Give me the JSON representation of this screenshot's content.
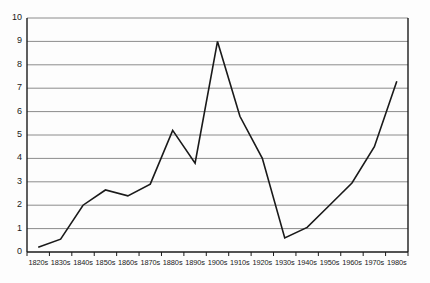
{
  "chart_data": {
    "type": "line",
    "title": "",
    "subtitle": "",
    "xlabel": "",
    "ylabel": "",
    "categories": [
      "1820s",
      "1830s",
      "1840s",
      "1850s",
      "1860s",
      "1870s",
      "1880s",
      "1890s",
      "1900s",
      "1910s",
      "1920s",
      "1930s",
      "1940s",
      "1950s",
      "1960s",
      "1970s",
      "1980s"
    ],
    "values": [
      0.2,
      0.55,
      2.0,
      2.65,
      2.4,
      2.9,
      5.2,
      3.8,
      9.0,
      5.8,
      4.0,
      0.6,
      1.05,
      2.0,
      2.95,
      4.5,
      7.3
    ],
    "series": [
      {
        "name": "series-1",
        "values": [
          0.2,
          0.55,
          2.0,
          2.65,
          2.4,
          2.9,
          5.2,
          3.8,
          9.0,
          5.8,
          4.0,
          0.6,
          1.05,
          2.0,
          2.95,
          4.5,
          7.3
        ]
      }
    ],
    "ylim": [
      0,
      10
    ],
    "y_ticks": [
      0,
      1,
      2,
      3,
      4,
      5,
      6,
      7,
      8,
      9,
      10
    ],
    "y_tick_labels": [
      "0",
      "1",
      "2",
      "3",
      "4",
      "5",
      "6",
      "7",
      "8",
      "9",
      "10"
    ],
    "grid": true,
    "grid_axis": "y",
    "legend": false,
    "legend_position": "none",
    "annotations": []
  },
  "style": {
    "line_color": "#1a1a1a",
    "grid_color": "#8c8c8c",
    "axis_color": "#1a1a1a",
    "background_color": "#fdfdfd",
    "text_color": "#1a1a1a"
  }
}
